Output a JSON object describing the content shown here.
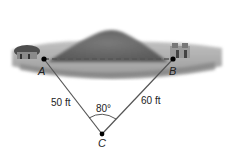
{
  "diagram": {
    "points": {
      "A": {
        "label": "A",
        "x": 44,
        "y": 59
      },
      "B": {
        "label": "B",
        "x": 173,
        "y": 59
      },
      "C": {
        "label": "C",
        "x": 102,
        "y": 134
      }
    },
    "sides": {
      "AC": {
        "label": "50 ft"
      },
      "BC": {
        "label": "60 ft"
      },
      "AB": {
        "label": "",
        "style": "dashed"
      }
    },
    "angle_C": {
      "label": "80°"
    },
    "scene": {
      "left_object": "house",
      "right_object": "house",
      "middle_object": "hill"
    },
    "colors": {
      "line": "#555555",
      "dashed_line": "#555555",
      "point": "#000000",
      "hill": "#6e6e6e",
      "ground": "#a8a8a8"
    }
  }
}
